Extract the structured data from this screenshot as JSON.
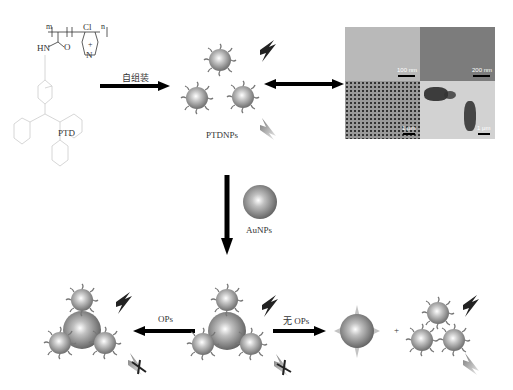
{
  "labels": {
    "ptd": "PTD",
    "self_assembly": "自组装",
    "ptdnps": "PTDNPs",
    "aunps": "AuNPs",
    "ops": "OPs",
    "no_ops": "无 OPs",
    "plus": "+"
  },
  "structure": {
    "hn": "HN",
    "o": "O",
    "cl": "Cl",
    "plus_charge": "+",
    "n_atom": "N",
    "m": "m",
    "n": "n"
  },
  "tem": {
    "panels": [
      {
        "position": "top-left",
        "scale": "100 nm"
      },
      {
        "position": "top-right",
        "scale": "200 nm"
      },
      {
        "position": "bottom-left",
        "scale": "1 μm"
      },
      {
        "position": "bottom-right",
        "scale": "1 μm"
      }
    ]
  },
  "colors": {
    "arrow": "#000000",
    "sphere": "#9a9a9a",
    "structure_light": "#cccccc",
    "structure_dark": "#333333"
  }
}
